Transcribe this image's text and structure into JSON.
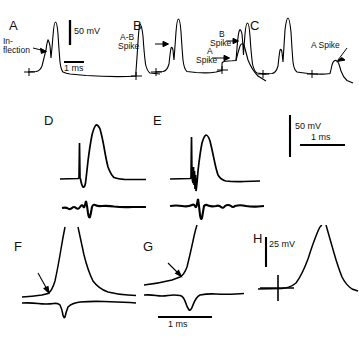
{
  "figure": {
    "type": "electrophysiology-multipanel",
    "background_color": "#ffffff",
    "trace_color": "#000000",
    "panels": [
      {
        "id": "A",
        "letter": "A",
        "annotations": [
          "In-",
          "flection"
        ],
        "scalebars": [
          {
            "label": "50 mV",
            "orientation": "vertical"
          },
          {
            "label": "1 ms",
            "orientation": "horizontal"
          }
        ]
      },
      {
        "id": "B",
        "letter": "B",
        "annotations": [
          "A-B",
          "Spike",
          "A",
          "Spike",
          "B",
          "Spike"
        ],
        "scalebars": []
      },
      {
        "id": "C",
        "letter": "C",
        "annotations": [
          "A Spike"
        ],
        "scalebars": []
      },
      {
        "id": "D",
        "letter": "D",
        "annotations": [],
        "scalebars": []
      },
      {
        "id": "E",
        "letter": "E",
        "annotations": [],
        "scalebars": [
          {
            "label": "50 mV",
            "orientation": "vertical"
          },
          {
            "label": "1 ms",
            "orientation": "horizontal"
          }
        ]
      },
      {
        "id": "F",
        "letter": "F",
        "annotations": [],
        "scalebars": []
      },
      {
        "id": "G",
        "letter": "G",
        "annotations": [],
        "scalebars": [
          {
            "label": "1 ms",
            "orientation": "horizontal"
          }
        ]
      },
      {
        "id": "H",
        "letter": "H",
        "annotations": [],
        "scalebars": [
          {
            "label": "25 mV",
            "orientation": "vertical"
          }
        ]
      }
    ],
    "labels": {
      "a_letter": "A",
      "b_letter": "B",
      "c_letter": "C",
      "d_letter": "D",
      "e_letter": "E",
      "f_letter": "F",
      "g_letter": "G",
      "h_letter": "H",
      "inflection_line1": "In-",
      "inflection_line2": "flection",
      "ab_spike_line1": "A-B",
      "ab_spike_line2": "Spike",
      "a_spike_line1": "A",
      "a_spike_line2": "Spike",
      "b_spike_line1": "B",
      "b_spike_line2": "Spike",
      "c_a_spike": "A Spike",
      "scale_50mv_a": "50 mV",
      "scale_1ms_a": "1 ms",
      "scale_50mv_e": "50 mV",
      "scale_1ms_e": "1 ms",
      "scale_1ms_g": "1 ms",
      "scale_25mv_h": "25 mV"
    }
  }
}
